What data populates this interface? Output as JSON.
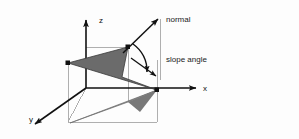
{
  "figure": {
    "background_color": "#fdfdfd",
    "ink_color": "#111111",
    "plane_fill": "#6e6e6e",
    "projection_fill": "#8a8a8a",
    "guide_color": "#9a9a9a"
  },
  "axes": {
    "z_label": "z",
    "x_label": "x",
    "y_label": "y"
  },
  "annotations": {
    "normal_label": "normal",
    "slope_angle_label": "slope angle"
  },
  "geometry": {
    "origin": [
      86,
      88
    ],
    "plane_vertices": [
      [
        68,
        63
      ],
      [
        128,
        47
      ],
      [
        157,
        90
      ]
    ],
    "plane_notch": [
      [
        128,
        47
      ],
      [
        122,
        77
      ],
      [
        157,
        90
      ]
    ],
    "projection_vertices": [
      [
        70,
        123
      ],
      [
        128,
        102
      ],
      [
        157,
        90
      ]
    ],
    "normal_arrow": [
      [
        124,
        52
      ],
      [
        159,
        18
      ]
    ],
    "vertical_guide": [
      [
        160,
        20
      ],
      [
        160,
        80
      ]
    ],
    "slope_arc_center": [
      124,
      52
    ]
  }
}
